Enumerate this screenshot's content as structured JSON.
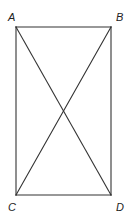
{
  "diagram": {
    "type": "rectangle-with-diagonals",
    "stroke_color": "#333333",
    "stroke_width": 1.1,
    "vertices": {
      "A": {
        "x": 16,
        "y": 27,
        "label": "A",
        "label_x": 8,
        "label_y": 21
      },
      "B": {
        "x": 111,
        "y": 27,
        "label": "B",
        "label_x": 116,
        "label_y": 21
      },
      "C": {
        "x": 16,
        "y": 195,
        "label": "C",
        "label_x": 8,
        "label_y": 211
      },
      "D": {
        "x": 111,
        "y": 195,
        "label": "D",
        "label_x": 116,
        "label_y": 211
      }
    },
    "segments": [
      {
        "name": "side-ab",
        "from": "A",
        "to": "B"
      },
      {
        "name": "side-bd",
        "from": "B",
        "to": "D"
      },
      {
        "name": "side-dc",
        "from": "D",
        "to": "C"
      },
      {
        "name": "side-ca",
        "from": "C",
        "to": "A"
      },
      {
        "name": "diagonal-ad",
        "from": "A",
        "to": "D"
      },
      {
        "name": "diagonal-bc",
        "from": "B",
        "to": "C"
      }
    ]
  }
}
